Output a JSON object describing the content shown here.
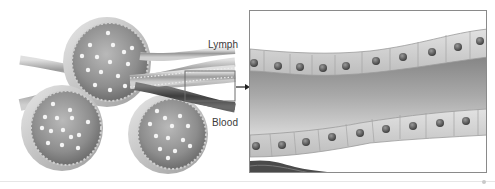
{
  "figure": {
    "type": "anatomical-illustration",
    "labels": {
      "lymph": "Lymph",
      "blood": "Blood"
    },
    "callout": {
      "arrow": "right-arrow",
      "target": "magnified-inset"
    },
    "colors": {
      "background": "#ffffff",
      "tissue_light": "#d9d9d9",
      "tissue_mid": "#a8a8a8",
      "tissue_dark": "#5a5a5a",
      "nucleus": "#4a4a4a",
      "cell_dot": "#f4f4f4",
      "frame": "#8a8a8a"
    }
  }
}
